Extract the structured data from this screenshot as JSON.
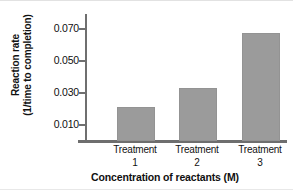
{
  "chart_data": {
    "type": "bar",
    "title": "",
    "categories": [
      "Treatment 1",
      "Treatment 2",
      "Treatment 3"
    ],
    "category_lines": [
      {
        "name": "Treatment",
        "num": "1"
      },
      {
        "name": "Treatment",
        "num": "2"
      },
      {
        "name": "Treatment",
        "num": "3"
      }
    ],
    "values": [
      0.0215,
      0.0332,
      0.0677
    ],
    "xlabel": "Concentration of reactants (M)",
    "ylabel": "Reaction rate",
    "ylabel_line2": "(1/time to completion)",
    "ylim": [
      0,
      0.079
    ],
    "yticks": [
      0.01,
      0.03,
      0.05,
      0.07
    ],
    "ytick_labels": [
      "0.010",
      "0.030",
      "0.050",
      "0.070"
    ],
    "grid": false,
    "legend": false,
    "bar_color": "#9b9b9b",
    "axis_color": "#6f6f6f",
    "text_color": "#101010"
  }
}
